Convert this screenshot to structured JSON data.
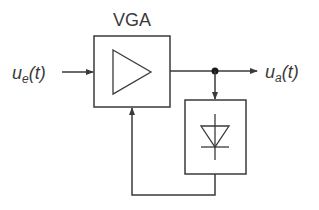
{
  "diagram": {
    "block_title": "VGA",
    "input_signal": {
      "symbol": "u",
      "subscript": "e",
      "arg": "(t)"
    },
    "output_signal": {
      "symbol": "u",
      "subscript": "a",
      "arg": "(t)"
    },
    "blocks": [
      {
        "id": "vga",
        "label": "VGA",
        "symbol": "amplifier-triangle"
      },
      {
        "id": "detector",
        "label": "",
        "symbol": "diode"
      }
    ],
    "colors": {
      "line": "#3a3a3a",
      "background": "#ffffff"
    }
  }
}
